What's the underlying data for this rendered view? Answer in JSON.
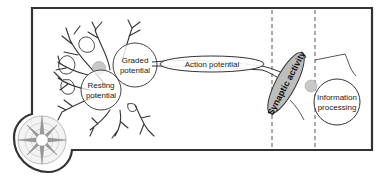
{
  "diagram": {
    "labels": {
      "resting_potential": [
        "Resting",
        "potential"
      ],
      "graded_potential": [
        "Graded",
        "potential"
      ],
      "action_potential": "Action potential",
      "synaptic_activity": "Synaptic activity",
      "information_processing": [
        "Information",
        "processing"
      ]
    },
    "icons": {
      "compass": "compass-rose-icon",
      "neuron": "neuron-dendrite-icon"
    },
    "colors": {
      "frame": "#333333",
      "circle_stroke": "#444444",
      "synapse_fill": "#bdbdbd",
      "nucleus_fill": "#c8c8c8",
      "dashed_line": "#555555"
    }
  }
}
